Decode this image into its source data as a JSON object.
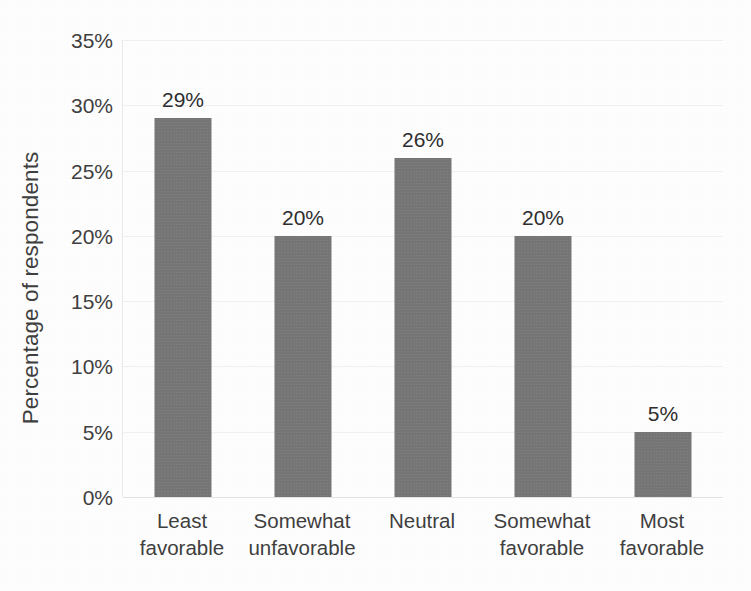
{
  "chart_data": {
    "type": "bar",
    "title": "",
    "xlabel": "",
    "ylabel": "Percentage of respondents",
    "categories": [
      "Least favorable",
      "Somewhat unfavorable",
      "Neutral",
      "Somewhat favorable",
      "Most favorable"
    ],
    "category_lines": [
      [
        "Least",
        "favorable"
      ],
      [
        "Somewhat",
        "unfavorable"
      ],
      [
        "Neutral",
        ""
      ],
      [
        "Somewhat",
        "favorable"
      ],
      [
        "Most",
        "favorable"
      ]
    ],
    "values": [
      29,
      20,
      26,
      20,
      5
    ],
    "value_labels": [
      "29%",
      "20%",
      "26%",
      "20%",
      "5%"
    ],
    "ylim": [
      0,
      35
    ],
    "ytick_values": [
      0,
      5,
      10,
      15,
      20,
      25,
      30,
      35
    ],
    "ytick_labels": [
      "0%",
      "5%",
      "10%",
      "15%",
      "20%",
      "25%",
      "30%",
      "35%"
    ],
    "grid": true,
    "legend": false,
    "legend_position": "none",
    "bar_color": "#757575",
    "gridline_color": "#f1f0ef",
    "axis_color": "#e3e2e1",
    "text_color": "#3f3f3f",
    "background_color": "#ffffff"
  }
}
